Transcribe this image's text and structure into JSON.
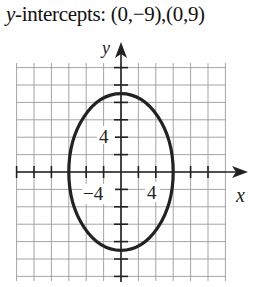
{
  "caption": {
    "var": "y",
    "text": "-intercepts: (0,−9),(0,9)"
  },
  "chart_data": {
    "type": "line",
    "xlabel": "x",
    "ylabel": "y",
    "grid": true,
    "grid_step": 2,
    "xlim": [
      -12,
      12
    ],
    "ylim": [
      -12,
      12
    ],
    "tick_labels": {
      "x": [
        "4"
      ],
      "y": [
        "4",
        "-4"
      ]
    },
    "series": [
      {
        "name": "ellipse x^2/36 + y^2/81 = 1",
        "shape": "ellipse",
        "center": [
          0,
          0
        ],
        "semi_axis_x": 6,
        "semi_axis_y": 9,
        "key_points": [
          [
            0,
            9
          ],
          [
            0,
            -9
          ],
          [
            6,
            0
          ],
          [
            -6,
            0
          ]
        ]
      }
    ]
  },
  "labels": {
    "x_axis": "x",
    "y_axis": "y",
    "x_tick": "4",
    "y_tick_pos": "4",
    "y_tick_neg": "−4"
  }
}
